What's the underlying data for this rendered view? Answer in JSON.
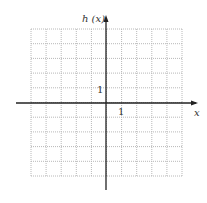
{
  "chart_data": {
    "type": "line",
    "title": "",
    "xlabel": "x",
    "ylabel": "h (x)",
    "xlim": [
      -5,
      5
    ],
    "ylim": [
      -5,
      5
    ],
    "grid": true,
    "tick_labels": {
      "x": [
        "1"
      ],
      "y": [
        "1"
      ]
    },
    "series": []
  },
  "labels": {
    "y_axis": "h (x)",
    "x_axis": "x",
    "x_tick": "1",
    "y_tick": "1"
  },
  "colors": {
    "axis": "#222222",
    "grid": "#b8b8b8"
  }
}
